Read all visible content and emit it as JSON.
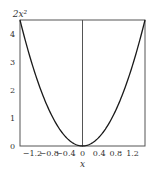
{
  "chart_data": {
    "type": "line",
    "title": "",
    "function": "2x^2",
    "series": [
      {
        "name": "2x^2",
        "x": [
          -1.5,
          -1.2,
          -0.9,
          -0.6,
          -0.3,
          0,
          0.3,
          0.6,
          0.9,
          1.2,
          1.5
        ],
        "values": [
          4.5,
          2.88,
          1.62,
          0.72,
          0.18,
          0,
          0.18,
          0.72,
          1.62,
          2.88,
          4.5
        ]
      }
    ],
    "xlabel": "x",
    "ylabel": "2x²",
    "xlim": [
      -1.5,
      1.5
    ],
    "ylim": [
      0,
      4.5
    ],
    "xticks": [
      "-1.2",
      "-0.8",
      "-0.4",
      "0",
      "0.4",
      "0.8",
      "1.2"
    ],
    "xtick_values": [
      -1.2,
      -0.8,
      -0.4,
      0,
      0.4,
      0.8,
      1.2
    ],
    "yticks": [
      "0",
      "1",
      "2",
      "3",
      "4"
    ],
    "ytick_values": [
      0,
      1,
      2,
      3,
      4
    ],
    "grid": false,
    "vertical_line_at_x": 0,
    "colors": {
      "curve": "#1a1a1a",
      "frame": "#555555",
      "text": "#333333"
    }
  }
}
